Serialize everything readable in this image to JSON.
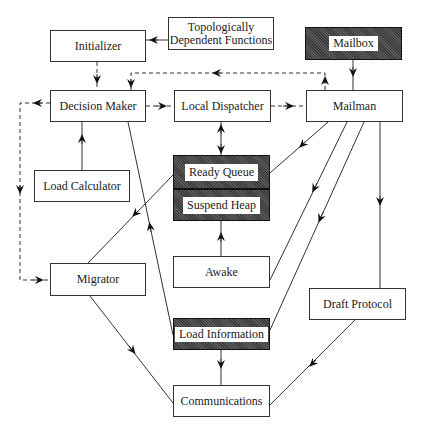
{
  "nodes": {
    "initializer": {
      "label": "Initializer",
      "style": "plain"
    },
    "topo_functions": {
      "label": "Topologically\nDependent Functions",
      "line1": "Topologically",
      "line2": "Dependent Functions",
      "style": "plain"
    },
    "mailbox": {
      "label": "Mailbox",
      "style": "shaded"
    },
    "decision_maker": {
      "label": "Decision Maker",
      "style": "plain"
    },
    "local_dispatcher": {
      "label": "Local Dispatcher",
      "style": "plain"
    },
    "mailman": {
      "label": "Mailman",
      "style": "plain"
    },
    "load_calculator": {
      "label": "Load Calculator",
      "style": "plain"
    },
    "ready_queue": {
      "label": "Ready Queue",
      "style": "shaded"
    },
    "suspend_heap": {
      "label": "Suspend Heap",
      "style": "shaded"
    },
    "awake": {
      "label": "Awake",
      "style": "plain"
    },
    "migrator": {
      "label": "Migrator",
      "style": "plain"
    },
    "draft_protocol": {
      "label": "Draft Protocol",
      "style": "plain"
    },
    "load_information": {
      "label": "Load Information",
      "style": "shaded"
    },
    "communications": {
      "label": "Communications",
      "style": "plain"
    }
  },
  "edges": [
    {
      "from": "Topologically Dependent Functions",
      "to": "Initializer",
      "style": "solid"
    },
    {
      "from": "Initializer",
      "to": "Decision Maker",
      "style": "dashed"
    },
    {
      "from": "Mailman",
      "to": "Decision Maker",
      "style": "dashed"
    },
    {
      "from": "Decision Maker",
      "to": "Local Dispatcher",
      "style": "dashed"
    },
    {
      "from": "Local Dispatcher",
      "to": "Mailman",
      "style": "dashed"
    },
    {
      "from": "Decision Maker",
      "to": "Migrator",
      "style": "dashed"
    },
    {
      "from": "Mailbox",
      "to": "Mailman",
      "style": "solid"
    },
    {
      "from": "Local Dispatcher",
      "to": "Ready Queue",
      "style": "solid",
      "bidirectional": true
    },
    {
      "from": "Load Calculator",
      "to": "Decision Maker",
      "style": "solid"
    },
    {
      "from": "Mailman",
      "to": "Ready Queue",
      "style": "solid"
    },
    {
      "from": "Mailman",
      "to": "Awake",
      "style": "solid"
    },
    {
      "from": "Mailman",
      "to": "Load Information",
      "style": "solid"
    },
    {
      "from": "Mailman",
      "to": "Draft Protocol",
      "style": "solid"
    },
    {
      "from": "Ready Queue",
      "to": "Migrator",
      "style": "solid"
    },
    {
      "from": "Load Information",
      "to": "Decision Maker",
      "style": "solid"
    },
    {
      "from": "Awake",
      "to": "Suspend Heap",
      "style": "solid"
    },
    {
      "from": "Migrator",
      "to": "Communications",
      "style": "solid"
    },
    {
      "from": "Load Information",
      "to": "Communications",
      "style": "solid"
    },
    {
      "from": "Draft Protocol",
      "to": "Communications",
      "style": "solid"
    }
  ]
}
